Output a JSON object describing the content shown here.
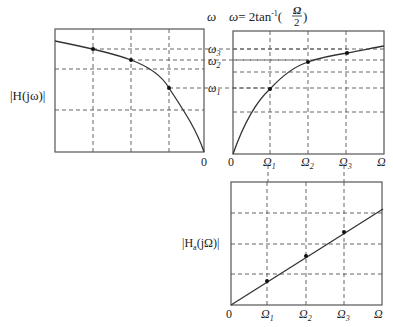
{
  "title_formula": {
    "omega_axis": "ω",
    "lhs": "ω",
    "eq": "= 2tan",
    "sup": "-1",
    "open": "(",
    "num": "Ω",
    "den": "2",
    "close": ")"
  },
  "left_plot": {
    "ylabel": "|H(jω)|",
    "origin_label": "0",
    "omega_labels": [
      {
        "text": "ω",
        "sub": "3"
      },
      {
        "text": "ω",
        "sub": "2"
      },
      {
        "text": "ω",
        "sub": "1"
      }
    ],
    "curve_points": [
      [
        55,
        41
      ],
      [
        93,
        49
      ],
      [
        131,
        60
      ],
      [
        150,
        70
      ],
      [
        169,
        88
      ],
      [
        185,
        110
      ],
      [
        197,
        132
      ],
      [
        204,
        152
      ]
    ],
    "markers": [
      [
        93,
        49
      ],
      [
        131,
        60
      ],
      [
        169,
        88
      ]
    ]
  },
  "right_plot": {
    "origin_label": "0",
    "x_axis_label": "Ω",
    "x_ticks": [
      {
        "text": "Ω",
        "sub": "1"
      },
      {
        "text": "Ω",
        "sub": "2"
      },
      {
        "text": "Ω",
        "sub": "3"
      }
    ],
    "markers": [
      [
        270,
        89
      ],
      [
        308,
        62
      ],
      [
        347,
        53
      ]
    ]
  },
  "bottom_plot": {
    "ylabel_main": "|H",
    "ylabel_sub": "a",
    "ylabel_rest": "(jΩ)|",
    "origin_label": "0",
    "x_axis_label": "Ω",
    "x_ticks": [
      {
        "text": "Ω",
        "sub": "1"
      },
      {
        "text": "Ω",
        "sub": "2"
      },
      {
        "text": "Ω",
        "sub": "3"
      }
    ],
    "markers": [
      [
        267,
        280
      ],
      [
        306,
        257
      ],
      [
        344,
        232
      ]
    ]
  },
  "colors": {
    "axis": "#555555",
    "curve": "#333333",
    "grid": "#555555",
    "marker": "#111111"
  }
}
